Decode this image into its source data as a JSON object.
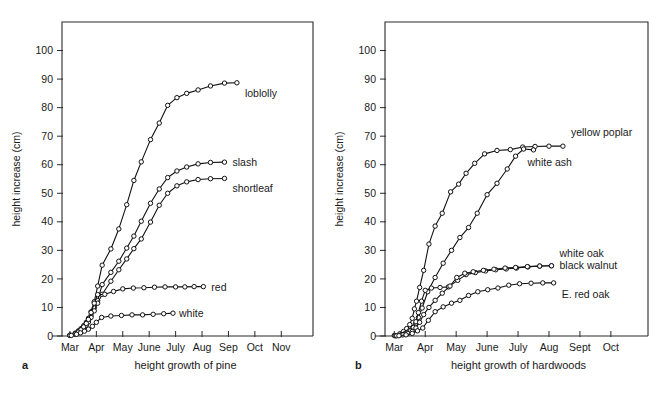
{
  "figure": {
    "panels": [
      {
        "letter": "a",
        "caption": "height growth of pine",
        "ylabel": "height increase (cm)"
      },
      {
        "letter": "b",
        "caption": "height growth of hardwoods",
        "ylabel": "height increase (cm)"
      }
    ]
  },
  "chart_data": [
    {
      "type": "line",
      "title": "height growth of pine",
      "panel": "a",
      "xlabel": "",
      "ylabel": "height increase (cm)",
      "ylim": [
        0,
        110
      ],
      "yticks": [
        0,
        10,
        20,
        30,
        40,
        50,
        60,
        70,
        80,
        90,
        100
      ],
      "xticks": [
        "Mar",
        "Apr",
        "May",
        "June",
        "July",
        "Aug",
        "Sep",
        "Oct",
        "Nov"
      ],
      "xlim": [
        0,
        9.5
      ],
      "grid": false,
      "legend_position": "inline-right-of-curve",
      "markers": "open-circle",
      "series": [
        {
          "name": "loblolly",
          "label": "loblolly",
          "points": [
            [
              0.3,
              0.3
            ],
            [
              0.5,
              1.0
            ],
            [
              0.62,
              1.8
            ],
            [
              0.72,
              2.6
            ],
            [
              0.82,
              3.6
            ],
            [
              0.92,
              4.8
            ],
            [
              1.0,
              6.2
            ],
            [
              1.1,
              8.5
            ],
            [
              1.22,
              12.0
            ],
            [
              1.35,
              17.5
            ],
            [
              1.52,
              24.8
            ],
            [
              1.85,
              30.5
            ],
            [
              2.15,
              37.5
            ],
            [
              2.45,
              46.0
            ],
            [
              2.72,
              54.5
            ],
            [
              3.0,
              61.0
            ],
            [
              3.35,
              68.8
            ],
            [
              3.68,
              74.6
            ],
            [
              4.0,
              80.8
            ],
            [
              4.35,
              83.5
            ],
            [
              4.72,
              85.0
            ],
            [
              5.15,
              86.2
            ],
            [
              5.62,
              87.6
            ],
            [
              6.15,
              88.6
            ],
            [
              6.62,
              88.7
            ]
          ]
        },
        {
          "name": "slash",
          "label": "slash",
          "points": [
            [
              0.3,
              0.2
            ],
            [
              0.5,
              0.8
            ],
            [
              0.62,
              1.5
            ],
            [
              0.72,
              2.2
            ],
            [
              0.82,
              3.1
            ],
            [
              0.92,
              4.2
            ],
            [
              1.0,
              5.4
            ],
            [
              1.1,
              7.2
            ],
            [
              1.22,
              9.8
            ],
            [
              1.35,
              12.4
            ],
            [
              1.52,
              18.0
            ],
            [
              1.85,
              22.3
            ],
            [
              2.15,
              26.2
            ],
            [
              2.45,
              30.8
            ],
            [
              2.72,
              35.0
            ],
            [
              3.0,
              40.2
            ],
            [
              3.35,
              46.5
            ],
            [
              3.68,
              51.5
            ],
            [
              4.0,
              55.5
            ],
            [
              4.35,
              57.8
            ],
            [
              4.72,
              59.2
            ],
            [
              5.15,
              60.3
            ],
            [
              5.62,
              60.8
            ],
            [
              6.15,
              60.9
            ]
          ]
        },
        {
          "name": "shortleaf",
          "label": "shortleaf",
          "points": [
            [
              0.3,
              0.2
            ],
            [
              0.5,
              0.7
            ],
            [
              0.62,
              1.3
            ],
            [
              0.72,
              2.0
            ],
            [
              0.82,
              2.8
            ],
            [
              0.92,
              3.8
            ],
            [
              1.0,
              4.9
            ],
            [
              1.1,
              6.5
            ],
            [
              1.22,
              8.8
            ],
            [
              1.35,
              11.5
            ],
            [
              1.52,
              14.6
            ],
            [
              1.85,
              19.2
            ],
            [
              2.15,
              23.2
            ],
            [
              2.45,
              27.0
            ],
            [
              2.72,
              30.6
            ],
            [
              3.0,
              34.0
            ],
            [
              3.35,
              39.9
            ],
            [
              3.68,
              45.8
            ],
            [
              4.0,
              50.0
            ],
            [
              4.35,
              52.6
            ],
            [
              4.72,
              54.0
            ],
            [
              5.15,
              54.8
            ],
            [
              5.62,
              55.1
            ],
            [
              6.15,
              55.2
            ]
          ]
        },
        {
          "name": "red",
          "label": "red",
          "points": [
            [
              0.3,
              0.2
            ],
            [
              0.5,
              0.7
            ],
            [
              0.62,
              1.4
            ],
            [
              0.72,
              2.2
            ],
            [
              0.82,
              3.2
            ],
            [
              0.92,
              4.4
            ],
            [
              1.0,
              5.8
            ],
            [
              1.1,
              8.2
            ],
            [
              1.22,
              11.5
            ],
            [
              1.35,
              14.5
            ],
            [
              1.62,
              14.6
            ],
            [
              1.95,
              15.6
            ],
            [
              2.3,
              16.5
            ],
            [
              2.7,
              16.8
            ],
            [
              3.1,
              16.9
            ],
            [
              3.5,
              17.1
            ],
            [
              3.9,
              17.2
            ],
            [
              4.3,
              17.2
            ],
            [
              4.65,
              17.2
            ],
            [
              5.0,
              17.3
            ],
            [
              5.35,
              17.3
            ]
          ]
        },
        {
          "name": "white",
          "label": "white",
          "points": [
            [
              0.35,
              0.2
            ],
            [
              0.55,
              0.6
            ],
            [
              0.7,
              1.1
            ],
            [
              0.85,
              1.7
            ],
            [
              1.0,
              2.4
            ],
            [
              1.15,
              3.4
            ],
            [
              1.3,
              4.8
            ],
            [
              1.5,
              6.5
            ],
            [
              1.85,
              7.0
            ],
            [
              2.25,
              7.2
            ],
            [
              2.65,
              7.4
            ],
            [
              3.05,
              7.4
            ],
            [
              3.45,
              7.6
            ],
            [
              3.85,
              7.8
            ],
            [
              4.2,
              8.0
            ]
          ]
        }
      ]
    },
    {
      "type": "line",
      "title": "height growth of hardwoods",
      "panel": "b",
      "xlabel": "",
      "ylabel": "height increase (cm)",
      "ylim": [
        0,
        110
      ],
      "yticks": [
        0,
        10,
        20,
        30,
        40,
        50,
        60,
        70,
        80,
        90,
        100
      ],
      "xticks": [
        "Mar",
        "Apr",
        "May",
        "June",
        "July",
        "Aug",
        "Sept",
        "Oct"
      ],
      "xlim": [
        0,
        8.5
      ],
      "grid": false,
      "legend_position": "inline-right-of-curve",
      "markers": "open-circle",
      "series": [
        {
          "name": "yellow-poplar",
          "label": "yellow poplar",
          "points": [
            [
              0.3,
              0.2
            ],
            [
              0.48,
              0.8
            ],
            [
              0.6,
              1.6
            ],
            [
              0.7,
              2.6
            ],
            [
              0.8,
              4.0
            ],
            [
              0.88,
              6.2
            ],
            [
              0.95,
              9.5
            ],
            [
              1.02,
              12.2
            ],
            [
              1.12,
              17.0
            ],
            [
              1.25,
              23.0
            ],
            [
              1.42,
              32.2
            ],
            [
              1.62,
              38.5
            ],
            [
              1.85,
              43.0
            ],
            [
              2.12,
              50.5
            ],
            [
              2.38,
              53.2
            ],
            [
              2.62,
              57.0
            ],
            [
              2.9,
              60.5
            ],
            [
              3.22,
              63.8
            ],
            [
              3.62,
              65.0
            ],
            [
              4.05,
              65.3
            ],
            [
              4.45,
              66.2
            ],
            [
              4.85,
              66.4
            ],
            [
              5.3,
              66.5
            ],
            [
              5.75,
              66.5
            ]
          ]
        },
        {
          "name": "white-ash",
          "label": "white ash",
          "points": [
            [
              0.32,
              0.1
            ],
            [
              0.52,
              0.5
            ],
            [
              0.66,
              1.0
            ],
            [
              0.78,
              1.8
            ],
            [
              0.88,
              2.8
            ],
            [
              0.98,
              4.2
            ],
            [
              1.08,
              6.5
            ],
            [
              1.2,
              9.8
            ],
            [
              1.38,
              15.5
            ],
            [
              1.62,
              20.5
            ],
            [
              1.88,
              25.5
            ],
            [
              2.15,
              30.0
            ],
            [
              2.42,
              34.5
            ],
            [
              2.7,
              38.0
            ],
            [
              2.98,
              43.0
            ],
            [
              3.3,
              49.5
            ],
            [
              3.62,
              53.5
            ],
            [
              3.95,
              58.5
            ],
            [
              4.22,
              63.0
            ],
            [
              4.48,
              65.5
            ],
            [
              4.8,
              65.2
            ]
          ]
        },
        {
          "name": "white-oak",
          "label": "white oak",
          "points": [
            [
              0.35,
              0.1
            ],
            [
              0.55,
              0.5
            ],
            [
              0.7,
              1.0
            ],
            [
              0.82,
              1.8
            ],
            [
              0.92,
              3.0
            ],
            [
              1.0,
              5.0
            ],
            [
              1.08,
              8.2
            ],
            [
              1.18,
              12.2
            ],
            [
              1.3,
              16.0
            ],
            [
              1.5,
              16.8
            ],
            [
              1.78,
              17.0
            ],
            [
              2.05,
              17.2
            ],
            [
              2.35,
              19.5
            ],
            [
              2.62,
              21.5
            ],
            [
              2.92,
              22.2
            ],
            [
              3.25,
              22.8
            ],
            [
              3.58,
              23.2
            ],
            [
              3.92,
              23.5
            ],
            [
              4.25,
              23.8
            ],
            [
              4.62,
              24.2
            ],
            [
              5.0,
              24.5
            ],
            [
              5.38,
              24.6
            ]
          ]
        },
        {
          "name": "black-walnut",
          "label": "black walnut",
          "points": [
            [
              0.38,
              0.1
            ],
            [
              0.58,
              0.4
            ],
            [
              0.74,
              0.9
            ],
            [
              0.88,
              1.6
            ],
            [
              1.0,
              2.8
            ],
            [
              1.12,
              4.8
            ],
            [
              1.25,
              7.5
            ],
            [
              1.42,
              10.0
            ],
            [
              1.62,
              12.5
            ],
            [
              1.85,
              15.0
            ],
            [
              2.1,
              17.5
            ],
            [
              2.32,
              20.5
            ],
            [
              2.58,
              22.0
            ],
            [
              2.85,
              22.5
            ],
            [
              3.18,
              23.0
            ],
            [
              3.52,
              23.4
            ],
            [
              3.88,
              23.8
            ],
            [
              4.22,
              24.0
            ],
            [
              4.6,
              24.3
            ],
            [
              5.0,
              24.5
            ],
            [
              5.38,
              24.6
            ]
          ]
        },
        {
          "name": "e-red-oak",
          "label": "E. red oak",
          "points": [
            [
              0.45,
              0.1
            ],
            [
              0.68,
              0.4
            ],
            [
              0.88,
              0.9
            ],
            [
              1.05,
              1.8
            ],
            [
              1.22,
              2.8
            ],
            [
              1.4,
              5.5
            ],
            [
              1.62,
              8.5
            ],
            [
              1.88,
              10.2
            ],
            [
              2.15,
              11.5
            ],
            [
              2.42,
              12.5
            ],
            [
              2.7,
              14.2
            ],
            [
              3.0,
              15.5
            ],
            [
              3.32,
              16.2
            ],
            [
              3.65,
              16.8
            ],
            [
              4.0,
              17.8
            ],
            [
              4.35,
              18.3
            ],
            [
              4.72,
              18.5
            ],
            [
              5.1,
              18.6
            ],
            [
              5.45,
              18.6
            ]
          ]
        }
      ]
    }
  ]
}
